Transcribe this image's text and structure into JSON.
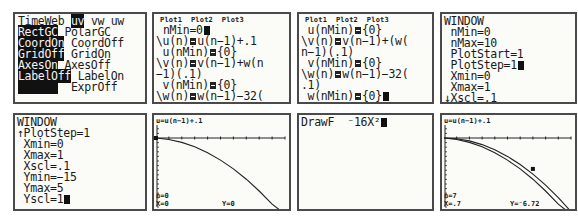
{
  "panels": {
    "mode_screen": {
      "row1": {
        "item0": "TimeWeb",
        "item1_selected": "uv",
        "item2": "vw",
        "item3": "uw"
      },
      "row2": {
        "selected": "RectGC",
        "other": "PolarGC"
      },
      "row3": {
        "selected": "CoordOn",
        "other": "CoordOff"
      },
      "row4": {
        "selected": "GridOff",
        "other": "GridOn"
      },
      "row5": {
        "selected": "AxesOn",
        "other": "AxesOff"
      },
      "row6": {
        "selected": "LabelOff",
        "other": "LabelOn"
      },
      "row7": {
        "selected": "ExprOn",
        "other": "ExprOff"
      }
    },
    "seq_editor_1": {
      "header": "Plot1  Plot2  Plot3",
      "lines": [
        {
          "text": "nMin=0",
          "cursor": true
        },
        {
          "prefix": "\\u(n)",
          "expr": "u(n−1)+.1"
        },
        {
          "prefix": " u(nMin)",
          "expr": "{0}"
        },
        {
          "prefix": "\\v(n)",
          "expr": "v(n−1)+w(n"
        },
        {
          "text": "−1)(.1)"
        },
        {
          "prefix": " v(nMin)",
          "expr": "{0}"
        },
        {
          "prefix": "\\w(n)",
          "expr": "w(n−1)−32("
        }
      ]
    },
    "seq_editor_2": {
      "header": "Plot1  Plot2  Plot3",
      "lines": [
        {
          "prefix": " u(nMin)",
          "expr": "{0}"
        },
        {
          "prefix": "\\v(n)",
          "expr": "v(n−1)+(w("
        },
        {
          "text": "n−1)(.1)"
        },
        {
          "prefix": " v(nMin)",
          "expr": "{0}"
        },
        {
          "prefix": "\\w(n)",
          "expr": "w(n−1)−32("
        },
        {
          "text": ".1)"
        },
        {
          "prefix": " w(nMin)",
          "expr": "{0}",
          "cursor": true
        }
      ]
    },
    "window_1": {
      "title": "WINDOW",
      "lines": [
        " nMin=0",
        " nMax=10",
        " PlotStart=1",
        " PlotStep=1",
        " Xmin=0",
        " Xmax=1",
        "↓Xscl=.1"
      ],
      "cursor_line": 3
    },
    "window_2": {
      "title": "WINDOW",
      "lines": [
        "↑PlotStep=1",
        " Xmin=0",
        " Xmax=1",
        " Xscl=.1",
        " Ymin=−15",
        " Ymax=5",
        " Yscl=1"
      ],
      "cursor_line": 6
    },
    "graph_1": {
      "expr_label": "u=u(n−1)+.1",
      "n_label": "n=0",
      "x_label": "X=0",
      "y_label": "Y=0"
    },
    "drawf": {
      "command": "DrawF  ⁻16X²"
    },
    "graph_2": {
      "expr_label": "u=u(n−1)+.1",
      "n_label": "n=7",
      "x_label": "X=.7",
      "y_label": "Y=⁻6.72"
    }
  },
  "chart_data": [
    {
      "type": "line",
      "title": "u=u(n−1)+.1",
      "xlim": [
        0,
        1
      ],
      "ylim": [
        -15,
        5
      ],
      "x_tick_step": 0.1,
      "y_tick_step": 1,
      "series": [
        {
          "name": "sequence plot (u,w)",
          "x": [
            0,
            0.1,
            0.2,
            0.3,
            0.4,
            0.5,
            0.6,
            0.7,
            0.8,
            0.9,
            1.0
          ],
          "y": [
            0,
            -0.32,
            -0.96,
            -1.92,
            -3.2,
            -4.8,
            -6.72,
            -8.96,
            -11.52,
            -14.4,
            -17.6
          ]
        }
      ],
      "trace": {
        "n": 0,
        "x": 0,
        "y": 0
      }
    },
    {
      "type": "line",
      "title": "u=u(n−1)+.1",
      "xlim": [
        0,
        1
      ],
      "ylim": [
        -15,
        5
      ],
      "series": [
        {
          "name": "sequence plot (u,w)",
          "x": [
            0,
            0.1,
            0.2,
            0.3,
            0.4,
            0.5,
            0.6,
            0.7,
            0.8,
            0.9,
            1.0
          ],
          "y": [
            0,
            -0.32,
            -0.96,
            -1.92,
            -3.2,
            -4.8,
            -6.72,
            -8.96,
            -11.52,
            -14.4,
            -17.6
          ]
        },
        {
          "name": "DrawF −16X²",
          "x": [
            0,
            0.1,
            0.2,
            0.3,
            0.4,
            0.5,
            0.6,
            0.7,
            0.8,
            0.9,
            1.0
          ],
          "y": [
            0,
            -0.16,
            -0.64,
            -1.44,
            -2.56,
            -4,
            -5.76,
            -7.84,
            -10.24,
            -12.96,
            -16
          ]
        }
      ],
      "trace": {
        "n": 7,
        "x": 0.7,
        "y": -6.72
      }
    }
  ]
}
